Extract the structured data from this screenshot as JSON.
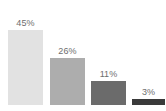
{
  "chart": {
    "background_color": "#ffffff",
    "label_color": "#6e6e6e",
    "baseline_y": 105,
    "plot_top": 30
  },
  "chart_data": {
    "type": "bar",
    "title": "",
    "subtitle": "",
    "xlabel": "",
    "ylabel": "",
    "categories": [
      "",
      "",
      "",
      ""
    ],
    "values": [
      45,
      26,
      11,
      3
    ],
    "value_labels": [
      "45%",
      "26%",
      "11%",
      "3%"
    ],
    "unit": "%",
    "ylim": [
      0,
      50
    ],
    "grid": false,
    "legend": false,
    "legend_position": "none",
    "axis_visible": false,
    "tick_labels_visible": false,
    "data_labels_visible": true,
    "data_label_position": "above-bar",
    "orientation": "vertical",
    "bar_colors": [
      "#e2e2e2",
      "#adadad",
      "#6b6b6b",
      "#3a3a3a"
    ],
    "bars": [
      {
        "label": "45%",
        "value": 45,
        "color": "#e2e2e2",
        "left_px": 8,
        "width_px": 35,
        "height_px": 75,
        "label_bottom_px": 77
      },
      {
        "label": "26%",
        "value": 26,
        "color": "#adadad",
        "left_px": 50,
        "width_px": 35,
        "height_px": 47,
        "label_bottom_px": 49
      },
      {
        "label": "11%",
        "value": 11,
        "color": "#6b6b6b",
        "left_px": 91,
        "width_px": 35,
        "height_px": 24,
        "label_bottom_px": 26
      },
      {
        "label": "3%",
        "value": 3,
        "color": "#3a3a3a",
        "left_px": 132,
        "width_px": 33,
        "height_px": 6,
        "label_bottom_px": 8
      }
    ]
  }
}
